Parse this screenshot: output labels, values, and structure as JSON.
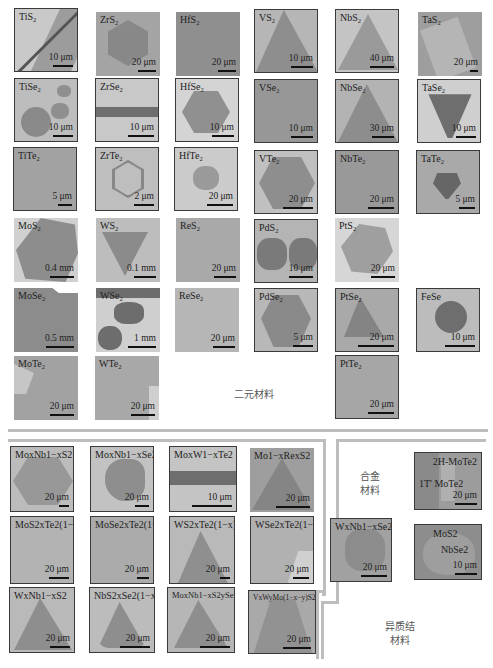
{
  "sections": {
    "binary": {
      "label": "二元材料"
    },
    "alloy": {
      "label_line1": "合金",
      "label_line2": "材料"
    },
    "hetero": {
      "label_line1": "异质结",
      "label_line2": "材料"
    }
  },
  "binary_tiles": [
    {
      "name": "TiS",
      "sub": "2",
      "scale": "10 μm"
    },
    {
      "name": "ZrS",
      "sub": "2",
      "scale": "20 μm"
    },
    {
      "name": "HfS",
      "sub": "2",
      "scale": "20 μm"
    },
    {
      "name": "VS",
      "sub": "2",
      "scale": "10 μm"
    },
    {
      "name": "NbS",
      "sub": "2",
      "scale": "40 μm"
    },
    {
      "name": "TaS",
      "sub": "2",
      "scale": "20 μm"
    },
    {
      "name": "TiSe",
      "sub": "2",
      "scale": "10 μm"
    },
    {
      "name": "ZrSe",
      "sub": "2",
      "scale": "10 μm"
    },
    {
      "name": "HfSe",
      "sub": "2",
      "scale": "10 μm"
    },
    {
      "name": "VSe",
      "sub": "2",
      "scale": "10 μm"
    },
    {
      "name": "NbSe",
      "sub": "2",
      "scale": "30 μm"
    },
    {
      "name": "TaSe",
      "sub": "2",
      "scale": "10 μm"
    },
    {
      "name": "TiTe",
      "sub": "2",
      "scale": "5 μm"
    },
    {
      "name": "ZrTe",
      "sub": "2",
      "scale": "2 μm"
    },
    {
      "name": "HfTe",
      "sub": "2",
      "scale": "20 μm"
    },
    {
      "name": "VTe",
      "sub": "2",
      "scale": "20 μm"
    },
    {
      "name": "NbTe",
      "sub": "2",
      "scale": "20 μm"
    },
    {
      "name": "TaTe",
      "sub": "2",
      "scale": "5 μm"
    },
    {
      "name": "MoS",
      "sub": "2",
      "scale": "0.4 mm"
    },
    {
      "name": "WS",
      "sub": "2",
      "scale": "0.1 mm"
    },
    {
      "name": "ReS",
      "sub": "2",
      "scale": "20 μm"
    },
    {
      "name": "PdS",
      "sub": "2",
      "scale": "10 μm"
    },
    {
      "name": "PtS",
      "sub": "2",
      "scale": "20 μm"
    },
    {
      "name": "MoSe",
      "sub": "2",
      "scale": "0.5 mm"
    },
    {
      "name": "WSe",
      "sub": "2",
      "scale": "1 mm"
    },
    {
      "name": "ReSe",
      "sub": "2",
      "scale": "20 μm"
    },
    {
      "name": "PdSe",
      "sub": "2",
      "scale": "5 μm"
    },
    {
      "name": "PtSe",
      "sub": "2",
      "scale": "20 μm"
    },
    {
      "name": "FeSe",
      "sub": "",
      "scale": "10 μm"
    },
    {
      "name": "MoTe",
      "sub": "2",
      "scale": "20 μm"
    },
    {
      "name": "WTe",
      "sub": "2",
      "scale": "20 μm"
    },
    {
      "name": "PtTe",
      "sub": "2",
      "scale": "20 μm"
    }
  ],
  "alloy_tiles": [
    {
      "label": "MoxNb1−xS2",
      "scale": "20 μm"
    },
    {
      "label": "MoxNb1−xSe2",
      "scale": "20 μm"
    },
    {
      "label": "MoxW1−xTe2",
      "scale": "10 μm"
    },
    {
      "label": "Mo1−xRexS2",
      "scale": "20 μm"
    },
    {
      "label": "MoS2xTe2(1−x)",
      "scale": "20 μm"
    },
    {
      "label": "MoSe2xTe2(1−x)",
      "scale": "20 μm"
    },
    {
      "label": "WS2xTe2(1−x)",
      "scale": "20 μm"
    },
    {
      "label": "WSe2xTe2(1−x)",
      "scale": "20 μm"
    },
    {
      "label": "WxNb1−xSe2",
      "scale": "20 μm"
    },
    {
      "label": "WxNb1−xS2",
      "scale": "20 μm"
    },
    {
      "label": "NbS2xSe2(1−x)",
      "scale": "20 μm"
    },
    {
      "label": "MoxNb1−xS2ySe2(1−y)",
      "scale": "20 μm"
    },
    {
      "label": "VxWyMo(1−x−y)S2zSe2(1−z)",
      "scale": "20 μm"
    }
  ],
  "hetero_tiles": [
    {
      "label1": "2H-MoTe2",
      "label2": "1T' MoTe2",
      "scale": "20 μm"
    },
    {
      "label1": "MoS2",
      "label2": "NbSe2",
      "scale": "10 μm"
    }
  ]
}
